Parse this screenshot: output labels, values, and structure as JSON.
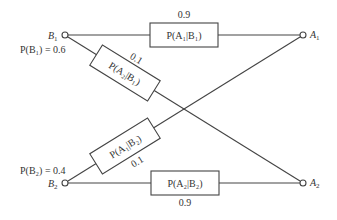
{
  "diagram": {
    "inputs": [
      {
        "id": "B1",
        "label": "B",
        "sub": "1",
        "prior_label": "P(B₁) = 0.6",
        "prior": 0.6
      },
      {
        "id": "B2",
        "label": "B",
        "sub": "2",
        "prior_label": "P(B₂) = 0.4",
        "prior": 0.4
      }
    ],
    "outputs": [
      {
        "id": "A1",
        "label": "A",
        "sub": "1"
      },
      {
        "id": "A2",
        "label": "A",
        "sub": "2"
      }
    ],
    "edges": [
      {
        "from": "B1",
        "to": "A1",
        "box_label": "P(A₁|B₁)",
        "value": "0.9"
      },
      {
        "from": "B1",
        "to": "A2",
        "box_label": "P(A₂|B₁)",
        "value": "0.1"
      },
      {
        "from": "B2",
        "to": "A1",
        "box_label": "P(A₁|B₂)",
        "value": "0.1"
      },
      {
        "from": "B2",
        "to": "A2",
        "box_label": "P(A₂|B₂)",
        "value": "0.9"
      }
    ]
  }
}
